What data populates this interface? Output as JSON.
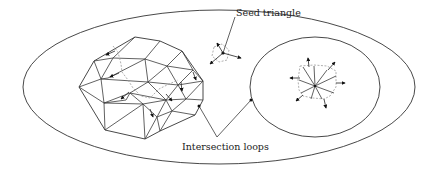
{
  "figure": {
    "type": "diagram",
    "labels": {
      "seed_triangle": "Seed triangle",
      "intersection_loops": "Intersection loops"
    },
    "colors": {
      "line": "#333333",
      "dashed_front": "#9a9a9a",
      "background": "#ffffff"
    },
    "regions": [
      {
        "name": "outer-domain",
        "shape": "ellipse"
      },
      {
        "name": "meshed-region",
        "shape": "polygon",
        "content": "triangulated mesh with advancing front arrows"
      },
      {
        "name": "seed-region",
        "shape": "point",
        "content": "seed triangle with outward arrows"
      },
      {
        "name": "inner-loop",
        "shape": "ellipse",
        "content": "radial fan of triangles with outward arrows"
      }
    ]
  }
}
